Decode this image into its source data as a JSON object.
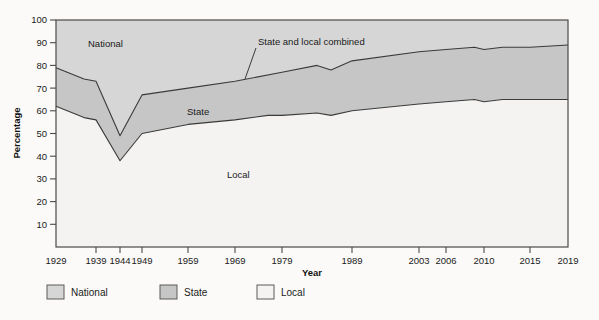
{
  "chart_data": {
    "type": "area",
    "stacked": true,
    "title": "",
    "xlabel": "Year",
    "ylabel": "Percentage",
    "ylim": [
      0,
      100
    ],
    "yticks": [
      10,
      20,
      30,
      40,
      50,
      60,
      70,
      80,
      90,
      100
    ],
    "grid": false,
    "categories": [
      "1929",
      "1939",
      "1944",
      "1949",
      "1959",
      "1969",
      "1979",
      "1989",
      "2003",
      "2006",
      "2010",
      "2015",
      "2019"
    ],
    "xtick_positions_px": [
      56,
      96,
      120,
      142,
      188,
      235,
      282,
      352,
      419,
      446,
      484,
      530,
      568
    ],
    "legend": {
      "position": "bottom-center",
      "entries": [
        {
          "name": "National",
          "color": "#d6d6d6"
        },
        {
          "name": "State",
          "color": "#c6c6c6"
        },
        {
          "name": "Local",
          "color": "#f2f1ef"
        }
      ]
    },
    "series": [
      {
        "name": "Local",
        "description": "Lower boundary curve: percentage accounted for by Local",
        "color": "#f2f1ef",
        "points": [
          {
            "year": 1929,
            "value": 62
          },
          {
            "year": 1936,
            "value": 57
          },
          {
            "year": 1939,
            "value": 56
          },
          {
            "year": 1944,
            "value": 38
          },
          {
            "year": 1949,
            "value": 50
          },
          {
            "year": 1959,
            "value": 54
          },
          {
            "year": 1969,
            "value": 56
          },
          {
            "year": 1976,
            "value": 58
          },
          {
            "year": 1979,
            "value": 58
          },
          {
            "year": 1984,
            "value": 59
          },
          {
            "year": 1986,
            "value": 58
          },
          {
            "year": 1989,
            "value": 60
          },
          {
            "year": 2003,
            "value": 63
          },
          {
            "year": 2006,
            "value": 64
          },
          {
            "year": 2009,
            "value": 65
          },
          {
            "year": 2010,
            "value": 64
          },
          {
            "year": 2012,
            "value": 65
          },
          {
            "year": 2015,
            "value": 65
          },
          {
            "year": 2019,
            "value": 65
          }
        ]
      },
      {
        "name": "State",
        "description": "Middle band between the Local curve and the State-and-local-combined curve",
        "color": "#c6c6c6",
        "band_top_curve": "State and local combined",
        "band_bottom_curve": "Local"
      },
      {
        "name": "State and local combined",
        "description": "Upper boundary curve; area above it up to 100 is National",
        "color": "#d6d6d6",
        "points": [
          {
            "year": 1929,
            "value": 79
          },
          {
            "year": 1936,
            "value": 74
          },
          {
            "year": 1939,
            "value": 73
          },
          {
            "year": 1944,
            "value": 49
          },
          {
            "year": 1949,
            "value": 67
          },
          {
            "year": 1959,
            "value": 70
          },
          {
            "year": 1969,
            "value": 73
          },
          {
            "year": 1979,
            "value": 77
          },
          {
            "year": 1984,
            "value": 80
          },
          {
            "year": 1986,
            "value": 78
          },
          {
            "year": 1989,
            "value": 82
          },
          {
            "year": 2003,
            "value": 86
          },
          {
            "year": 2006,
            "value": 87
          },
          {
            "year": 2009,
            "value": 88
          },
          {
            "year": 2010,
            "value": 87
          },
          {
            "year": 2012,
            "value": 88
          },
          {
            "year": 2015,
            "value": 88
          },
          {
            "year": 2019,
            "value": 89
          }
        ]
      },
      {
        "name": "National",
        "description": "Top band between the State-and-local-combined curve and 100%",
        "color": "#d6d6d6"
      }
    ],
    "annotations": [
      {
        "text": "National",
        "x_px": 88,
        "y_px": 47,
        "anchor": "start"
      },
      {
        "text": "State",
        "x_px": 187,
        "y_px": 115,
        "anchor": "start"
      },
      {
        "text": "Local",
        "x_px": 227,
        "y_px": 178,
        "anchor": "start"
      },
      {
        "text": "State and local combined",
        "x_px": 258,
        "y_px": 45,
        "anchor": "start",
        "leader_line": {
          "x1": 256,
          "y1": 48,
          "x2": 245,
          "y2": 79
        }
      }
    ]
  },
  "axes": {
    "y_title": "Percentage",
    "x_title": "Year",
    "y_tick_labels": [
      "100",
      "90",
      "80",
      "70",
      "60",
      "50",
      "40",
      "30",
      "20",
      "10"
    ],
    "x_tick_labels": [
      "1929",
      "1939",
      "1944",
      "1949",
      "1959",
      "1969",
      "1979",
      "1989",
      "2003",
      "2006",
      "2010",
      "2015",
      "2019"
    ]
  },
  "legend": {
    "items": [
      {
        "label": "National",
        "swatch": "#d6d6d6"
      },
      {
        "label": "State",
        "swatch": "#c6c6c6"
      },
      {
        "label": "Local",
        "swatch": "#f4f3f1"
      }
    ]
  },
  "colors": {
    "national_fill": "#d6d6d6",
    "state_fill": "#c6c6c6",
    "local_fill": "#f4f3f1",
    "line": "#3a3a3a",
    "axis": "#4a4a4a",
    "page_bg": "#fbfaf8"
  }
}
